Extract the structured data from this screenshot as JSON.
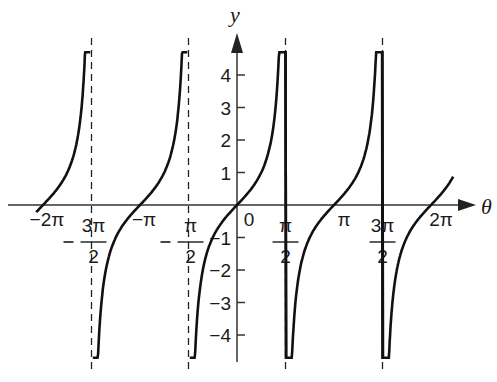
{
  "chart_data": {
    "type": "line",
    "title": "",
    "function": "y = tan(theta)",
    "xlabel": "θ",
    "ylabel": "y",
    "xlim": [
      -6.5,
      7.2
    ],
    "ylim": [
      -4.8,
      5.0
    ],
    "grid": false,
    "legend": null,
    "x_tick_labels": [
      {
        "value": -6.2832,
        "label": "−2π"
      },
      {
        "value": -4.7124,
        "label": "−3π/2"
      },
      {
        "value": -3.1416,
        "label": "−π"
      },
      {
        "value": -1.5708,
        "label": "−π/2"
      },
      {
        "value": 0,
        "label": "0"
      },
      {
        "value": 1.5708,
        "label": "π/2"
      },
      {
        "value": 3.1416,
        "label": "π"
      },
      {
        "value": 4.7124,
        "label": "3π/2"
      },
      {
        "value": 6.2832,
        "label": "2π"
      }
    ],
    "y_ticks": [
      -4,
      -3,
      -2,
      -1,
      1,
      2,
      3,
      4
    ],
    "y_tick_labels": [
      "−4",
      "−3",
      "−2",
      "−1",
      "1",
      "2",
      "3",
      "4"
    ],
    "asymptotes": [
      -4.7124,
      -1.5708,
      1.5708,
      4.7124
    ],
    "series": [
      {
        "name": "tan θ branch 1",
        "x_range": [
          -6.5,
          -4.75
        ]
      },
      {
        "name": "tan θ branch 2",
        "x_range": [
          -4.67,
          -1.61
        ]
      },
      {
        "name": "tan θ branch 3",
        "x_range": [
          -1.53,
          1.61
        ]
      },
      {
        "name": "tan θ branch 4",
        "x_range": [
          1.53,
          4.75
        ]
      },
      {
        "name": "tan θ branch 5",
        "x_range": [
          4.67,
          7.0
        ]
      }
    ],
    "sample_points": [
      {
        "x": -6.2832,
        "y": 0
      },
      {
        "x": -3.1416,
        "y": 0
      },
      {
        "x": 0,
        "y": 0
      },
      {
        "x": 0.7854,
        "y": 1
      },
      {
        "x": -0.7854,
        "y": -1
      },
      {
        "x": 3.1416,
        "y": 0
      },
      {
        "x": 6.2832,
        "y": 0
      }
    ]
  },
  "labels": {
    "y_axis": "y",
    "x_axis": "θ",
    "origin": "0"
  },
  "colors": {
    "curve": "#111111",
    "axis": "#333333",
    "background": "#ffffff"
  }
}
